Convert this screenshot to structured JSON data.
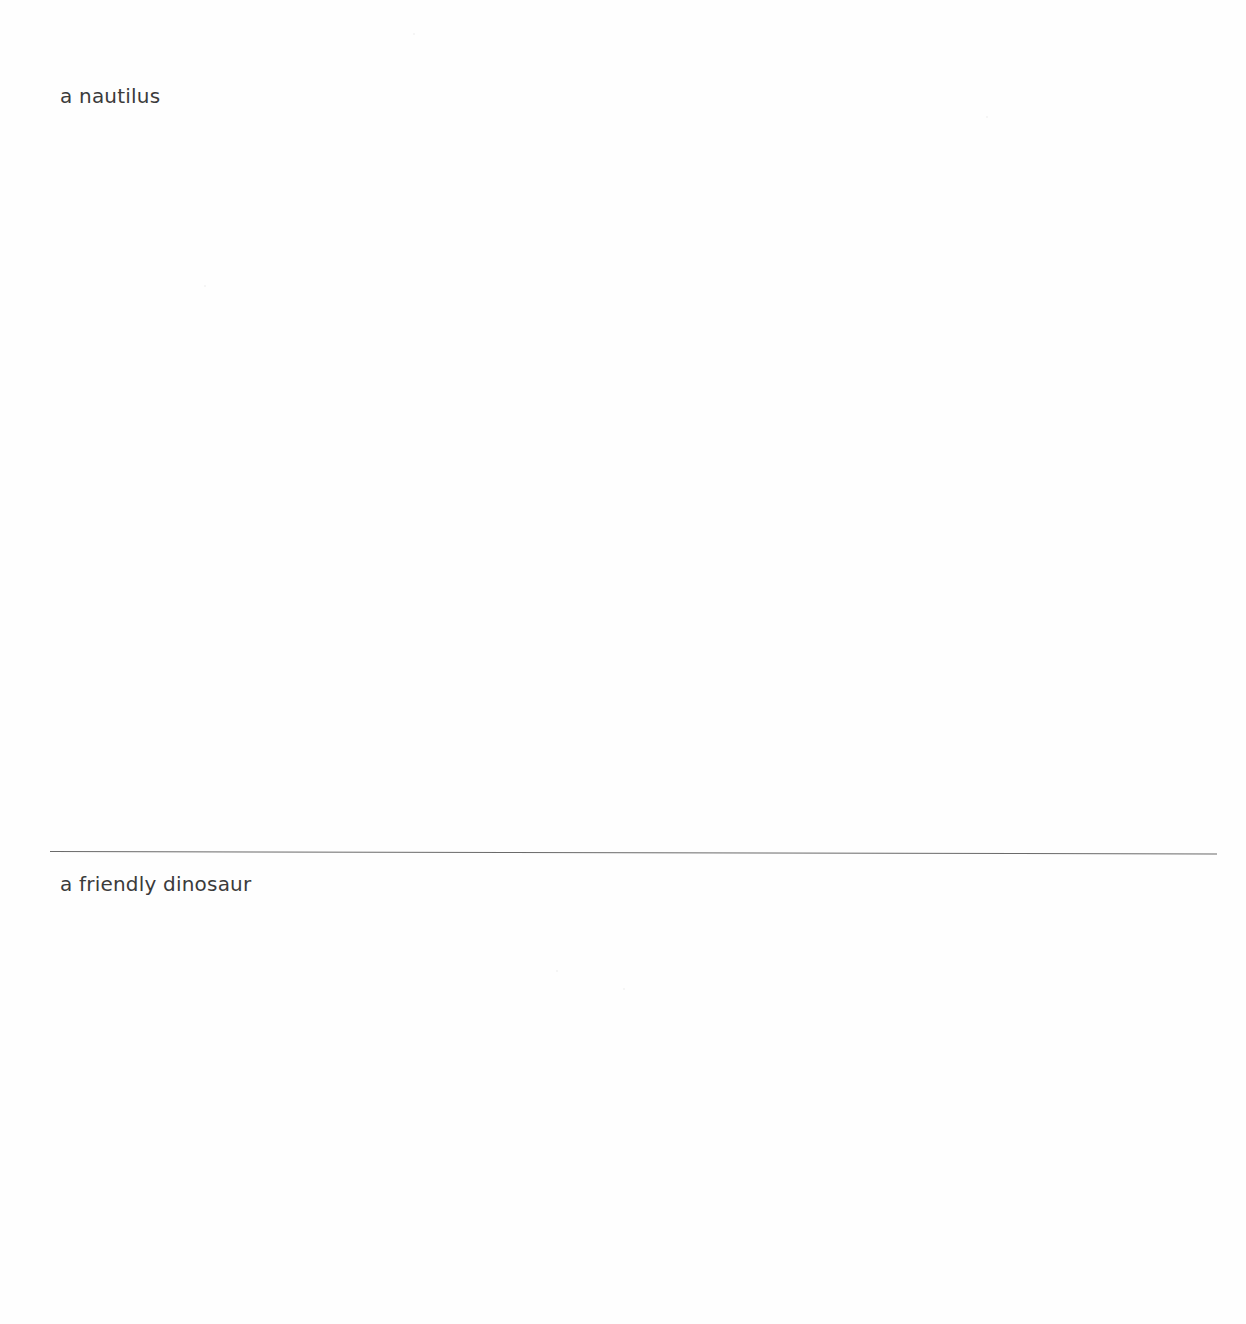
{
  "document": {
    "sections": [
      {
        "label": "a nautilus"
      },
      {
        "label": "a friendly dinosaur"
      }
    ],
    "colors": {
      "text": "#3b3b3b",
      "divider": "#6a6a6a",
      "background": "#fefefe"
    }
  }
}
